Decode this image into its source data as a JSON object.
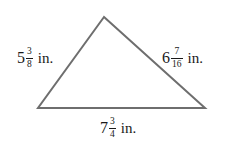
{
  "figure": {
    "shape": "triangle",
    "stroke_color": "#6e6e6e",
    "vertices": {
      "apex": [
        104,
        17
      ],
      "bottom_left": [
        38,
        108
      ],
      "bottom_right": [
        205,
        108
      ]
    },
    "sides": {
      "left": {
        "whole": "5",
        "numerator": "3",
        "denominator": "8",
        "unit": "in."
      },
      "right": {
        "whole": "6",
        "numerator": "7",
        "denominator": "16",
        "unit": "in."
      },
      "bottom": {
        "whole": "7",
        "numerator": "3",
        "denominator": "4",
        "unit": "in."
      }
    }
  }
}
